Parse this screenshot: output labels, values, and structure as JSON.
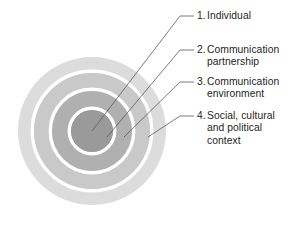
{
  "diagram": {
    "type": "concentric-circles",
    "center": {
      "x": 92,
      "y": 131
    },
    "rings": [
      {
        "id": "ring-4",
        "level": 4,
        "radius": 74,
        "color": "#dcdcdc",
        "label_ref": "4"
      },
      {
        "id": "ring-3",
        "level": 3,
        "radius": 58,
        "color": "#c9c9c9",
        "label_ref": "3"
      },
      {
        "id": "ring-2",
        "level": 2,
        "radius": 40,
        "color": "#b0b0b0",
        "label_ref": "2"
      },
      {
        "id": "ring-1",
        "level": 1,
        "radius": 21,
        "color": "#9a9a9a",
        "label_ref": "1"
      }
    ],
    "separator_color": "#ffffff",
    "separator_width": 3.4,
    "leader_line_color": "#58595b",
    "leader_line_width": 0.8,
    "leaders": [
      {
        "id": "leader-1",
        "from_x": 92,
        "from_y": 131,
        "bend_x": 180,
        "bend_y": 16,
        "to_x": 194,
        "to_y": 16
      },
      {
        "id": "leader-2",
        "from_x": 107,
        "from_y": 137,
        "bend_x": 180,
        "bend_y": 50,
        "to_x": 194,
        "to_y": 50
      },
      {
        "id": "leader-3",
        "from_x": 124,
        "from_y": 137,
        "bend_x": 180,
        "bend_y": 82,
        "to_x": 194,
        "to_y": 82
      },
      {
        "id": "leader-4",
        "from_x": 148,
        "from_y": 137,
        "bend_x": 180,
        "bend_y": 116,
        "to_x": 194,
        "to_y": 116
      }
    ]
  },
  "labels": [
    {
      "id": "1",
      "number": "1.",
      "line1": "Individual",
      "line2": "",
      "line3": ""
    },
    {
      "id": "2",
      "number": "2.",
      "line1": "Communication",
      "line2": "partnership",
      "line3": ""
    },
    {
      "id": "3",
      "number": "3.",
      "line1": "Communication",
      "line2": "environment",
      "line3": ""
    },
    {
      "id": "4",
      "number": "4.",
      "line1": "Social, cultural",
      "line2": "and political",
      "line3": "context"
    }
  ],
  "colors": {
    "background": "#ffffff",
    "text": "#231f20",
    "leader": "#58595b",
    "ring_outer": "#dcdcdc",
    "ring_third": "#c9c9c9",
    "ring_second": "#b0b0b0",
    "ring_center": "#9a9a9a",
    "separator": "#ffffff"
  }
}
